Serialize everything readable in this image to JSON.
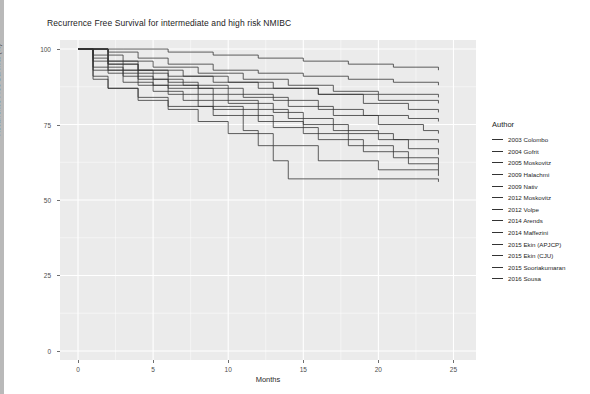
{
  "chart_data": {
    "type": "line",
    "title": "Recurrence Free Survival for intermediate and high risk NMIBC",
    "xlabel": "Months",
    "ylabel": "Recurrence Free Survival (%)",
    "legend_title": "Author",
    "legend_position": "right",
    "grid": true,
    "step": "post",
    "xlim": [
      -1.2,
      26.5
    ],
    "ylim": [
      -3,
      103
    ],
    "xticks": [
      0,
      5,
      10,
      15,
      20,
      25
    ],
    "xtick_labels": [
      "0",
      "5",
      "10",
      "15",
      "20",
      "25"
    ],
    "yticks": [
      0,
      25,
      50,
      75,
      100
    ],
    "ytick_labels": [
      "0",
      "25",
      "50",
      "75",
      "100"
    ],
    "line_color": "#333333",
    "panel_color": "#ebebeb",
    "grid_color": "#ffffff",
    "series": [
      {
        "name": "2003 Colombo",
        "x": [
          0,
          3,
          6,
          9,
          12,
          15,
          18,
          21,
          24
        ],
        "y": [
          100,
          100,
          99,
          98,
          97,
          96,
          95,
          94,
          93
        ]
      },
      {
        "name": "2004 Gofrit",
        "x": [
          0,
          2,
          4,
          6,
          9,
          12,
          15,
          18,
          21,
          24
        ],
        "y": [
          100,
          99,
          97,
          95,
          93,
          92,
          91,
          90,
          89,
          88
        ]
      },
      {
        "name": "2005 Moskovitz",
        "x": [
          0,
          1,
          3,
          5,
          8,
          11,
          14,
          17,
          20,
          24
        ],
        "y": [
          100,
          98,
          96,
          94,
          92,
          90,
          88,
          86,
          85,
          84
        ]
      },
      {
        "name": "2009 Halachmi",
        "x": [
          0,
          1,
          2,
          4,
          6,
          9,
          12,
          16,
          20,
          24
        ],
        "y": [
          100,
          97,
          95,
          93,
          91,
          89,
          87,
          85,
          83,
          82
        ]
      },
      {
        "name": "2009 Nativ",
        "x": [
          0,
          2,
          4,
          7,
          10,
          13,
          16,
          19,
          22,
          24
        ],
        "y": [
          100,
          96,
          93,
          91,
          89,
          87,
          85,
          82,
          80,
          79
        ]
      },
      {
        "name": "2012 Moskovitz",
        "x": [
          0,
          1,
          3,
          5,
          7,
          10,
          13,
          16,
          19,
          22,
          24
        ],
        "y": [
          100,
          96,
          93,
          90,
          88,
          85,
          83,
          80,
          78,
          77,
          76
        ]
      },
      {
        "name": "2012 Volpe",
        "x": [
          0,
          2,
          4,
          6,
          8,
          11,
          14,
          17,
          20,
          23,
          24
        ],
        "y": [
          100,
          95,
          92,
          89,
          87,
          84,
          81,
          78,
          75,
          73,
          72
        ]
      },
      {
        "name": "2014 Arends",
        "x": [
          0,
          1,
          3,
          5,
          8,
          10,
          13,
          15,
          18,
          21,
          24
        ],
        "y": [
          100,
          94,
          91,
          88,
          85,
          82,
          79,
          75,
          72,
          70,
          69
        ]
      },
      {
        "name": "2014 Maffezini",
        "x": [
          0,
          2,
          4,
          6,
          9,
          12,
          14,
          17,
          20,
          22,
          24
        ],
        "y": [
          100,
          93,
          90,
          87,
          83,
          80,
          77,
          73,
          70,
          67,
          65
        ]
      },
      {
        "name": "2015 Ekin (APJCP)",
        "x": [
          0,
          1,
          3,
          5,
          7,
          9,
          12,
          15,
          18,
          21,
          24
        ],
        "y": [
          100,
          93,
          89,
          86,
          83,
          80,
          76,
          72,
          68,
          64,
          62
        ]
      },
      {
        "name": "2015 Ekin (CJU)",
        "x": [
          0,
          2,
          4,
          6,
          8,
          11,
          13,
          16,
          19,
          22,
          24
        ],
        "y": [
          100,
          92,
          88,
          85,
          81,
          78,
          74,
          70,
          66,
          62,
          60
        ]
      },
      {
        "name": "2015 Sooriakumaran",
        "x": [
          0,
          1,
          2,
          4,
          6,
          8,
          10,
          13,
          16,
          20,
          24
        ],
        "y": [
          100,
          91,
          87,
          83,
          80,
          76,
          72,
          68,
          63,
          60,
          58
        ]
      },
      {
        "name": "2016 Sousa",
        "x": [
          0,
          1,
          2,
          4,
          6,
          9,
          11,
          12,
          13,
          14,
          24
        ],
        "y": [
          100,
          90,
          87,
          84,
          81,
          78,
          73,
          68,
          63,
          57,
          56
        ]
      }
    ]
  },
  "legend": {
    "title": "Author",
    "items": [
      "2003 Colombo",
      "2004 Gofrit",
      "2005 Moskovitz",
      "2009 Halachmi",
      "2009 Nativ",
      "2012 Moskovitz",
      "2012 Volpe",
      "2014 Arends",
      "2014 Maffezini",
      "2015 Ekin (APJCP)",
      "2015 Ekin (CJU)",
      "2015 Sooriakumaran",
      "2016 Sousa"
    ]
  }
}
